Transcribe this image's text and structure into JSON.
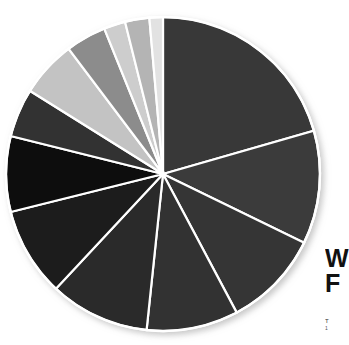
{
  "figure": {
    "background_color": "#ffffff",
    "side_label_line1": "W",
    "side_label_line2": "F",
    "side_caption": "T",
    "side_caption2": "1"
  },
  "chart_data": {
    "type": "pie",
    "title": "",
    "subtitle": "",
    "xlabel": "",
    "ylabel": "",
    "grid": false,
    "legend_position": "none",
    "start_angle_deg": 0,
    "direction": "clockwise",
    "center_x": 163,
    "center_y": 174,
    "radius": 157,
    "separator_color": "#ffffff",
    "separator_width": 2.2,
    "categories": [
      "Segment 1",
      "Segment 2",
      "Segment 3",
      "Segment 4",
      "Segment 5",
      "Segment 6",
      "Segment 7",
      "Segment 8",
      "Segment 9",
      "Segment 10",
      "Segment 11",
      "Segment 12",
      "Segment 13"
    ],
    "values": [
      20.6,
      11.7,
      10.0,
      9.4,
      10.3,
      9.2,
      7.8,
      5.0,
      5.8,
      4.2,
      2.2,
      2.5,
      1.3
    ],
    "angles_deg": [
      74.0,
      42.0,
      36.0,
      34.0,
      37.0,
      33.0,
      28.0,
      18.0,
      21.0,
      15.0,
      8.0,
      9.0,
      5.0
    ],
    "colors": [
      "#383838",
      "#3a3a3a",
      "#353535",
      "#303030",
      "#2a2a2a",
      "#1a1a1a",
      "#0d0d0d",
      "#333333",
      "#c3c3c3",
      "#8c8c8c",
      "#cdcdcd",
      "#b4b4b4",
      "#e2e2e2"
    ]
  }
}
